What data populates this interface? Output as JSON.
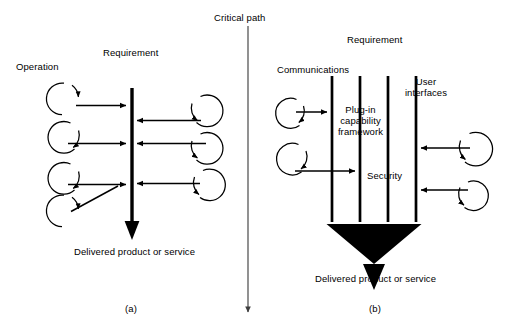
{
  "figure": {
    "title_label": "Critical path",
    "panels": [
      {
        "id": "a",
        "caption": "(a)",
        "labels": {
          "left_group": "Operation",
          "bar": "Requirement",
          "output": "Delivered product or service"
        },
        "bars": [
          {
            "name": "requirement",
            "x": 132,
            "y_top": 88,
            "y_bottom": 232,
            "width": 3.2,
            "arrow": "down"
          }
        ],
        "left_nodes": [
          {
            "cx": 64,
            "cy": 99,
            "r": 16,
            "arrow_to_bar_y": 105,
            "loop_arrow": "top-right"
          },
          {
            "cx": 64,
            "cy": 137,
            "r": 16,
            "arrow_to_bar_y": 143,
            "loop_arrow": "bottom-right"
          },
          {
            "cx": 64,
            "cy": 178,
            "r": 16,
            "arrow_to_bar_y": 184,
            "loop_arrow": "bottom-right"
          },
          {
            "cx": 64,
            "cy": 211,
            "r": 16,
            "arrow_to_bar_y": 184,
            "loop_arrow": "top-right"
          }
        ],
        "right_nodes": [
          {
            "cx": 208,
            "cy": 110,
            "r": 16,
            "arrow_to_bar_y": 120,
            "loop_arrow": "top-left"
          },
          {
            "cx": 208,
            "cy": 148,
            "r": 16,
            "arrow_to_bar_y": 143,
            "loop_arrow": "top-left"
          },
          {
            "cx": 208,
            "cy": 185,
            "r": 16,
            "arrow_to_bar_y": 183,
            "loop_arrow": "top-left"
          }
        ]
      },
      {
        "id": "b",
        "caption": "(b)",
        "labels": {
          "bar_group": "Requirement",
          "bar_1": "Communications",
          "bar_2_3_between": "Plug-in capability framework",
          "bar_4": "User interfaces",
          "bar_3_4_between": "Security",
          "output": "Delivered product or service"
        },
        "bars": [
          {
            "name": "communications",
            "x": 332,
            "y_top": 76,
            "y_bottom": 222,
            "width": 2.6
          },
          {
            "name": "plug-in-capability-framework",
            "x": 360,
            "y_top": 76,
            "y_bottom": 222,
            "width": 2.6
          },
          {
            "name": "security",
            "x": 388,
            "y_top": 76,
            "y_bottom": 222,
            "width": 2.6
          },
          {
            "name": "user-interfaces",
            "x": 416,
            "y_top": 76,
            "y_bottom": 222,
            "width": 2.6
          }
        ],
        "left_nodes": [
          {
            "cx": 290,
            "cy": 113,
            "r": 15,
            "arrow_to_bar_y": 112,
            "loop_arrow": "bottom-right"
          },
          {
            "cx": 292,
            "cy": 159,
            "r": 16,
            "arrow_to_bar_y": 171,
            "loop_arrow": "bottom-right"
          }
        ],
        "right_nodes": [
          {
            "cx": 476,
            "cy": 148,
            "r": 17,
            "arrow_to_bar_y": 148,
            "loop_arrow": "top-left"
          },
          {
            "cx": 474,
            "cy": 195,
            "r": 15,
            "arrow_to_bar_y": 190,
            "loop_arrow": "top-left"
          }
        ],
        "funnel": {
          "top_left_x": 327,
          "top_right_x": 421,
          "top_y": 224,
          "apex_x": 374,
          "apex_y": 263,
          "spout_half_width": 11,
          "spout_tip_y": 290
        }
      }
    ],
    "critical_path_arrow": {
      "x": 248,
      "y_top": 26,
      "y_bottom": 316
    },
    "colors": {
      "ink": "#000000",
      "background": "#ffffff",
      "critical_path_line": "#4a4a4a",
      "funnel_fill": "#000000"
    }
  }
}
